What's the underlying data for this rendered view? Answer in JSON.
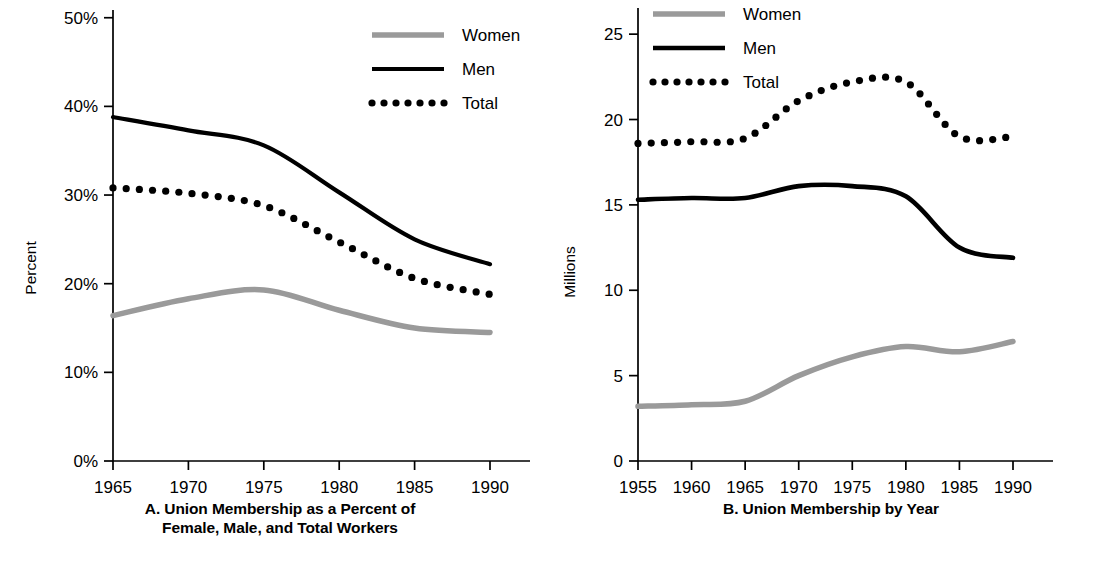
{
  "figure": {
    "background_color": "#ffffff",
    "series_colors": {
      "women": "#9a9a9a",
      "men": "#000000",
      "total": "#000000"
    }
  },
  "chart_a": {
    "caption_line1": "A. Union Membership as a Percent of",
    "caption_line2": "Female, Male, and Total Workers",
    "ylabel": "Percent",
    "ytick_labels": [
      "0%",
      "10%",
      "20%",
      "30%",
      "40%",
      "50%"
    ],
    "xtick_labels": [
      "1965",
      "1970",
      "1975",
      "1980",
      "1985",
      "1990"
    ],
    "legend": [
      {
        "label": "Women",
        "style": "solid-gray"
      },
      {
        "label": "Men",
        "style": "solid-black"
      },
      {
        "label": "Total",
        "style": "dotted-black"
      }
    ]
  },
  "chart_b": {
    "caption_line1": "B. Union Membership by Year",
    "caption_line2": "",
    "ylabel": "Millions",
    "ytick_labels": [
      "0",
      "5",
      "10",
      "15",
      "20",
      "25"
    ],
    "xtick_labels": [
      "1955",
      "1960",
      "1965",
      "1970",
      "1975",
      "1980",
      "1985",
      "1990"
    ],
    "legend": [
      {
        "label": "Women",
        "style": "solid-gray"
      },
      {
        "label": "Men",
        "style": "solid-black"
      },
      {
        "label": "Total",
        "style": "dotted-black"
      }
    ]
  },
  "chart_data": [
    {
      "type": "line",
      "id": "A",
      "title": "A. Union Membership as a Percent of Female, Male, and Total Workers",
      "xlabel": "",
      "ylabel": "Percent",
      "xlim": [
        1965,
        1990
      ],
      "ylim": [
        0,
        52
      ],
      "xticks": [
        1965,
        1970,
        1975,
        1980,
        1985,
        1990
      ],
      "yticks": [
        0,
        10,
        20,
        30,
        40,
        50
      ],
      "ytick_format": "percent",
      "grid": false,
      "legend_position": "top-right",
      "x": [
        1965,
        1970,
        1975,
        1980,
        1985,
        1990
      ],
      "series": [
        {
          "name": "Women",
          "style": "solid-gray",
          "color": "#9a9a9a",
          "values": [
            16.4,
            18.3,
            19.3,
            17.0,
            15.0,
            14.5
          ]
        },
        {
          "name": "Men",
          "style": "solid-black",
          "color": "#000000",
          "values": [
            38.8,
            37.3,
            35.6,
            30.3,
            25.0,
            22.2
          ]
        },
        {
          "name": "Total",
          "style": "dotted-black",
          "color": "#000000",
          "values": [
            30.8,
            30.2,
            28.8,
            24.7,
            20.6,
            18.8
          ]
        }
      ]
    },
    {
      "type": "line",
      "id": "B",
      "title": "B. Union Membership by Year",
      "xlabel": "",
      "ylabel": "Millions",
      "xlim": [
        1955,
        1990
      ],
      "ylim": [
        0,
        27
      ],
      "xticks": [
        1955,
        1960,
        1965,
        1970,
        1975,
        1980,
        1985,
        1990
      ],
      "yticks": [
        0,
        5,
        10,
        15,
        20,
        25
      ],
      "ytick_format": "number",
      "grid": false,
      "legend_position": "top-left",
      "x": [
        1955,
        1960,
        1965,
        1970,
        1975,
        1980,
        1985,
        1990
      ],
      "series": [
        {
          "name": "Women",
          "style": "solid-gray",
          "color": "#9a9a9a",
          "values": [
            3.2,
            3.3,
            3.5,
            5.0,
            6.1,
            6.7,
            6.4,
            7.0
          ]
        },
        {
          "name": "Men",
          "style": "solid-black",
          "color": "#000000",
          "values": [
            15.3,
            15.4,
            15.4,
            16.1,
            16.1,
            15.5,
            12.5,
            11.9
          ]
        },
        {
          "name": "Total",
          "style": "dotted-black",
          "color": "#000000",
          "values": [
            18.6,
            18.7,
            18.9,
            21.1,
            22.2,
            22.2,
            19.0,
            19.0
          ]
        }
      ]
    }
  ]
}
